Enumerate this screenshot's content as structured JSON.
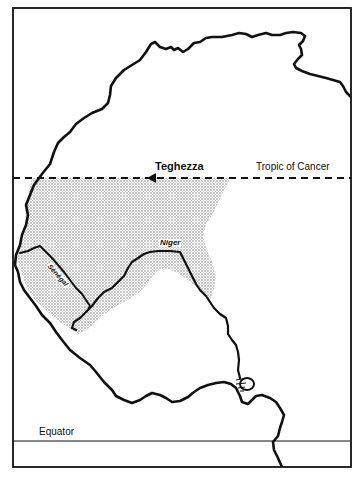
{
  "map": {
    "title": "West Africa: salt source Teghezza and the Niger/Sénégal region",
    "labels": {
      "place": "Teghezza",
      "tropic": "Tropic of Cancer",
      "equator": "Equator",
      "river_niger": "Niger",
      "river_senegal": "Sénégal"
    },
    "features": {
      "coastline": "coastline",
      "shaded_region": "stippled savanna/Sahel zone",
      "lines": [
        "Tropic of Cancer (dashed)",
        "Equator (solid)"
      ],
      "rivers": [
        "Niger",
        "Sénégal"
      ],
      "markers": [
        "Teghezza (filled triangle)"
      ]
    },
    "colors": {
      "ink": "#111111",
      "background": "#ffffff",
      "stipple": "#8a8a8a"
    }
  }
}
